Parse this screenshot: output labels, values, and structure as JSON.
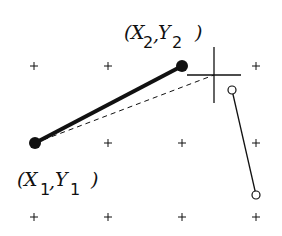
{
  "diagram": {
    "title": "",
    "points": {
      "p1": {
        "label_x": "X",
        "label_x_sub": "1",
        "label_y": "Y",
        "label_y_sub": "1",
        "x": 35,
        "y": 143
      },
      "p2": {
        "label_x": "X",
        "label_x_sub": "2",
        "label_y": "Y",
        "label_y_sub": "2",
        "x": 182,
        "y": 66
      }
    },
    "punct": {
      "open": "(",
      "comma": ",",
      "close": ")"
    },
    "crosshair": {
      "x": 214,
      "y": 75
    },
    "endpoints": [
      {
        "x": 232,
        "y": 90
      },
      {
        "x": 256,
        "y": 195
      }
    ],
    "grid": {
      "xs": [
        34,
        108,
        182,
        256
      ],
      "ys": [
        66,
        143,
        217
      ]
    },
    "colors": {
      "ink": "#111111",
      "background": "#ffffff"
    }
  }
}
